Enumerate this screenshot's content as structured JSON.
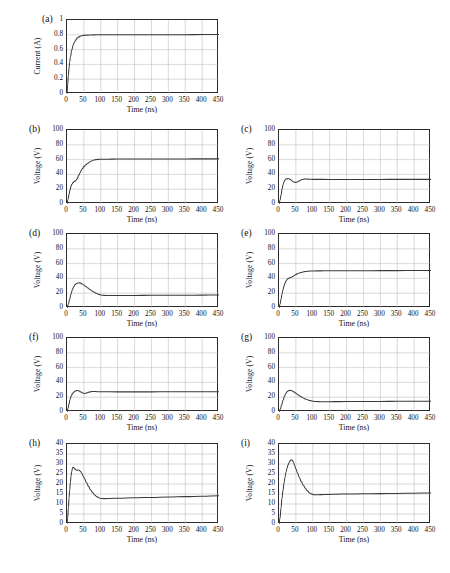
{
  "figure": {
    "panel_count": 9,
    "x_axis_label": "Time (ns)",
    "x_ticks": [
      "0",
      "50",
      "100",
      "150",
      "200",
      "250",
      "300",
      "350",
      "400",
      "450"
    ],
    "xlim": [
      0,
      450
    ],
    "curve_color": "#3a3a3a",
    "grid_color": "#b9b9b9",
    "axis_color": "#2b2b2b"
  },
  "chart_data": [
    {
      "type": "line",
      "panel": "(a)",
      "title": "",
      "xlabel": "Time (ns)",
      "ylabel": "Current (A)",
      "xlim": [
        0,
        450
      ],
      "ylim": [
        0,
        1
      ],
      "y_ticks": [
        "0",
        "0.2",
        "0.4",
        "0.6",
        "0.8",
        "1"
      ],
      "x_ticks": [
        "0",
        "50",
        "100",
        "150",
        "200",
        "250",
        "300",
        "350",
        "400",
        "450"
      ],
      "grid": true,
      "legend": "none",
      "x": [
        0,
        2,
        4,
        6,
        8,
        10,
        14,
        18,
        22,
        26,
        30,
        35,
        40,
        45,
        50,
        60,
        70,
        80,
        90,
        100,
        150,
        200,
        250,
        300,
        350,
        400,
        450
      ],
      "y": [
        0,
        0.13,
        0.25,
        0.35,
        0.43,
        0.5,
        0.59,
        0.66,
        0.7,
        0.73,
        0.755,
        0.772,
        0.782,
        0.788,
        0.792,
        0.796,
        0.798,
        0.799,
        0.8,
        0.8,
        0.801,
        0.801,
        0.802,
        0.802,
        0.802,
        0.803,
        0.803
      ]
    },
    {
      "type": "line",
      "panel": "(b)",
      "title": "",
      "xlabel": "Time (ns)",
      "ylabel": "Voltage (V)",
      "xlim": [
        0,
        450
      ],
      "ylim": [
        0,
        100
      ],
      "y_ticks": [
        "0",
        "20",
        "40",
        "60",
        "80",
        "100"
      ],
      "x_ticks": [
        "0",
        "50",
        "100",
        "150",
        "200",
        "250",
        "300",
        "350",
        "400",
        "450"
      ],
      "grid": true,
      "legend": "none",
      "x": [
        0,
        3,
        6,
        9,
        12,
        15,
        18,
        21,
        24,
        27,
        30,
        34,
        38,
        42,
        46,
        50,
        56,
        62,
        68,
        74,
        80,
        86,
        92,
        100,
        120,
        150,
        200,
        250,
        300,
        350,
        400,
        450
      ],
      "y": [
        0,
        6,
        13,
        19,
        24,
        27,
        29,
        30.5,
        31,
        32,
        34,
        38,
        42,
        45,
        48,
        50.5,
        53,
        55,
        57,
        58.5,
        59.5,
        60,
        60.3,
        60.5,
        60.6,
        60.7,
        60.8,
        60.8,
        60.9,
        60.9,
        61,
        61
      ]
    },
    {
      "type": "line",
      "panel": "(c)",
      "title": "",
      "xlabel": "Time (ns)",
      "ylabel": "Voltage (V)",
      "xlim": [
        0,
        450
      ],
      "ylim": [
        0,
        100
      ],
      "y_ticks": [
        "0",
        "20",
        "40",
        "60",
        "80",
        "100"
      ],
      "x_ticks": [
        "0",
        "50",
        "100",
        "150",
        "200",
        "250",
        "300",
        "350",
        "400",
        "450"
      ],
      "grid": true,
      "legend": "none",
      "x": [
        0,
        3,
        6,
        9,
        12,
        15,
        18,
        22,
        26,
        30,
        34,
        38,
        42,
        46,
        50,
        54,
        58,
        62,
        66,
        70,
        75,
        80,
        90,
        100,
        150,
        200,
        250,
        300,
        350,
        400,
        450
      ],
      "y": [
        0,
        5,
        12,
        20,
        26,
        30,
        32.5,
        34,
        34.3,
        34,
        33,
        31.5,
        30,
        29.3,
        29.2,
        29.8,
        30.8,
        31.8,
        32.6,
        33.2,
        33.6,
        33.7,
        33.5,
        33.3,
        33.2,
        33.2,
        33.2,
        33.2,
        33.3,
        33.3,
        33.3
      ]
    },
    {
      "type": "line",
      "panel": "(d)",
      "title": "",
      "xlabel": "Time (ns)",
      "ylabel": "Voltage (V)",
      "xlim": [
        0,
        450
      ],
      "ylim": [
        0,
        100
      ],
      "y_ticks": [
        "0",
        "20",
        "40",
        "60",
        "80",
        "100"
      ],
      "x_ticks": [
        "0",
        "50",
        "100",
        "150",
        "200",
        "250",
        "300",
        "350",
        "400",
        "450"
      ],
      "grid": true,
      "legend": "none",
      "x": [
        0,
        4,
        8,
        12,
        16,
        20,
        24,
        28,
        32,
        36,
        40,
        45,
        50,
        56,
        62,
        68,
        74,
        80,
        86,
        92,
        98,
        105,
        115,
        130,
        150,
        200,
        250,
        300,
        350,
        400,
        450
      ],
      "y": [
        0,
        5,
        12,
        19,
        25,
        29,
        31.5,
        33,
        33.8,
        34,
        33.6,
        32.5,
        31,
        29,
        27,
        25,
        23,
        21.5,
        20,
        18.8,
        17.8,
        17.2,
        16.9,
        16.8,
        16.9,
        17,
        17.1,
        17.2,
        17.3,
        17.4,
        17.5
      ]
    },
    {
      "type": "line",
      "panel": "(e)",
      "title": "",
      "xlabel": "Time (ns)",
      "ylabel": "Voltage (V)",
      "xlim": [
        0,
        450
      ],
      "ylim": [
        0,
        100
      ],
      "y_ticks": [
        "0",
        "20",
        "40",
        "60",
        "80",
        "100"
      ],
      "x_ticks": [
        "0",
        "50",
        "100",
        "150",
        "200",
        "250",
        "300",
        "350",
        "400",
        "450"
      ],
      "grid": true,
      "legend": "none",
      "x": [
        0,
        3,
        6,
        9,
        12,
        15,
        18,
        22,
        26,
        30,
        34,
        38,
        42,
        46,
        50,
        56,
        62,
        68,
        74,
        80,
        88,
        96,
        105,
        120,
        150,
        200,
        250,
        300,
        350,
        400,
        450
      ],
      "y": [
        0,
        5,
        12,
        19,
        25,
        30,
        34,
        37.5,
        39.5,
        40.5,
        41.2,
        42,
        43,
        44.2,
        45.3,
        46.6,
        47.6,
        48.4,
        49,
        49.4,
        49.8,
        50,
        50.1,
        50.2,
        50.3,
        50.4,
        50.4,
        50.5,
        50.5,
        50.6,
        50.6
      ]
    },
    {
      "type": "line",
      "panel": "(f)",
      "title": "",
      "xlabel": "Time (ns)",
      "ylabel": "Voltage (V)",
      "xlim": [
        0,
        450
      ],
      "ylim": [
        0,
        100
      ],
      "y_ticks": [
        "0",
        "20",
        "40",
        "60",
        "80",
        "100"
      ],
      "x_ticks": [
        "0",
        "50",
        "100",
        "150",
        "200",
        "250",
        "300",
        "350",
        "400",
        "450"
      ],
      "grid": true,
      "legend": "none",
      "x": [
        0,
        3,
        6,
        9,
        12,
        16,
        20,
        24,
        28,
        32,
        36,
        40,
        44,
        48,
        52,
        56,
        60,
        64,
        68,
        74,
        80,
        90,
        100,
        150,
        200,
        250,
        300,
        350,
        400,
        450
      ],
      "y": [
        0,
        5,
        11,
        17,
        21,
        24.5,
        26.8,
        28.2,
        28.9,
        29,
        28.5,
        27.5,
        26.3,
        25.4,
        25.1,
        25.4,
        26,
        26.7,
        27.2,
        27.6,
        27.7,
        27.5,
        27.3,
        27.2,
        27.2,
        27.2,
        27.3,
        27.3,
        27.4,
        27.4
      ]
    },
    {
      "type": "line",
      "panel": "(g)",
      "title": "",
      "xlabel": "Time (ns)",
      "ylabel": "Voltage (V)",
      "xlim": [
        0,
        450
      ],
      "ylim": [
        0,
        100
      ],
      "y_ticks": [
        "0",
        "20",
        "40",
        "60",
        "80",
        "100"
      ],
      "x_ticks": [
        "0",
        "50",
        "100",
        "150",
        "200",
        "250",
        "300",
        "350",
        "400",
        "450"
      ],
      "grid": true,
      "legend": "none",
      "x": [
        0,
        4,
        8,
        12,
        16,
        20,
        24,
        28,
        32,
        36,
        40,
        45,
        50,
        56,
        62,
        68,
        74,
        80,
        86,
        92,
        98,
        106,
        116,
        130,
        145,
        160,
        200,
        250,
        300,
        350,
        400,
        450
      ],
      "y": [
        0,
        4,
        10,
        16,
        21,
        25,
        27.5,
        28.8,
        29.2,
        29,
        28.3,
        27,
        25.3,
        23.4,
        21.6,
        20,
        18.5,
        17.2,
        16.2,
        15.4,
        14.8,
        14.3,
        14,
        13.9,
        13.9,
        14,
        14.1,
        14.2,
        14.3,
        14.4,
        14.5,
        14.5
      ]
    },
    {
      "type": "line",
      "panel": "(h)",
      "title": "",
      "xlabel": "Time (ns)",
      "ylabel": "Voltage (V)",
      "xlim": [
        0,
        450
      ],
      "ylim": [
        0,
        40
      ],
      "y_ticks": [
        "0",
        "5",
        "10",
        "15",
        "20",
        "25",
        "30",
        "35",
        "40"
      ],
      "x_ticks": [
        "0",
        "50",
        "100",
        "150",
        "200",
        "250",
        "300",
        "350",
        "400",
        "450"
      ],
      "grid": true,
      "legend": "none",
      "x": [
        0,
        2,
        4,
        6,
        8,
        10,
        12,
        14,
        16,
        18,
        20,
        22,
        25,
        28,
        31,
        34,
        37,
        40,
        44,
        48,
        52,
        58,
        64,
        70,
        76,
        82,
        88,
        94,
        100,
        110,
        130,
        150,
        200,
        250,
        300,
        350,
        400,
        450
      ],
      "y": [
        0,
        3,
        8,
        13,
        17,
        21,
        24,
        26.3,
        27.7,
        28.4,
        28.3,
        27.8,
        27.2,
        26.9,
        26.9,
        27,
        26.8,
        26.3,
        25.3,
        24,
        22.6,
        20.6,
        18.7,
        17,
        15.6,
        14.5,
        13.7,
        13.1,
        12.8,
        12.7,
        12.8,
        12.9,
        13.1,
        13.3,
        13.5,
        13.7,
        13.9,
        14.1
      ]
    },
    {
      "type": "line",
      "panel": "(i)",
      "title": "",
      "xlabel": "Time (ns)",
      "ylabel": "Voltage (V)",
      "xlim": [
        0,
        450
      ],
      "ylim": [
        0,
        40
      ],
      "y_ticks": [
        "0",
        "5",
        "10",
        "15",
        "20",
        "25",
        "30",
        "35",
        "40"
      ],
      "x_ticks": [
        "0",
        "50",
        "100",
        "150",
        "200",
        "250",
        "300",
        "350",
        "400",
        "450"
      ],
      "grid": true,
      "legend": "none",
      "x": [
        0,
        3,
        6,
        9,
        12,
        15,
        18,
        21,
        24,
        27,
        30,
        33,
        36,
        38,
        40,
        43,
        46,
        50,
        55,
        60,
        66,
        72,
        78,
        84,
        90,
        96,
        102,
        110,
        125,
        145,
        170,
        200,
        250,
        300,
        350,
        400,
        450
      ],
      "y": [
        0,
        3,
        8,
        13,
        17,
        20.5,
        23.5,
        26,
        28,
        29.6,
        30.8,
        31.6,
        32,
        32.1,
        31.8,
        30.8,
        29.4,
        27.6,
        25.4,
        23.4,
        21.2,
        19.4,
        17.9,
        16.6,
        15.6,
        15,
        14.7,
        14.6,
        14.7,
        14.8,
        14.9,
        15,
        15.1,
        15.2,
        15.3,
        15.4,
        15.5
      ]
    }
  ]
}
